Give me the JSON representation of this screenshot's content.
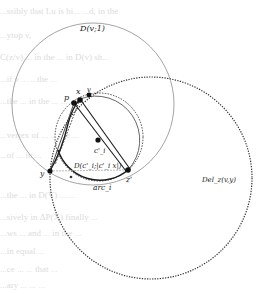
{
  "figure": {
    "labels": {
      "disk_v": "D(v;1)",
      "del_circle": "Del_z(v,y)",
      "small_disk": "D(c'_i;|c'_i x|)",
      "arc": "arc_i",
      "p": "p",
      "x": "x",
      "v": "v",
      "c": "c'_i",
      "y": "y",
      "z": "z'"
    },
    "bleed_text": [
      "...ssibly that Lu is bi... ...d, in the",
      "...ytop v,",
      "C(z/v) ... in the ... in D(v) sh...",
      "...if v ... ...the ...",
      "...the ... in the ... ...",
      "...vertex of ... ... ...e ...",
      "...of ... in ...",
      "...the ... in D(V) ... ...",
      "...sively in ΔP(X) finally ...",
      "...ws ... and ... in the ...",
      "...in equal ...",
      "...ce ... ... that ...",
      "...ary ... ... ..."
    ],
    "colors": {
      "thin_circle": "#9a9a9a",
      "dotted": "#333333",
      "dark": "#1a1a1a",
      "bleed": "#dcdcdc"
    }
  }
}
